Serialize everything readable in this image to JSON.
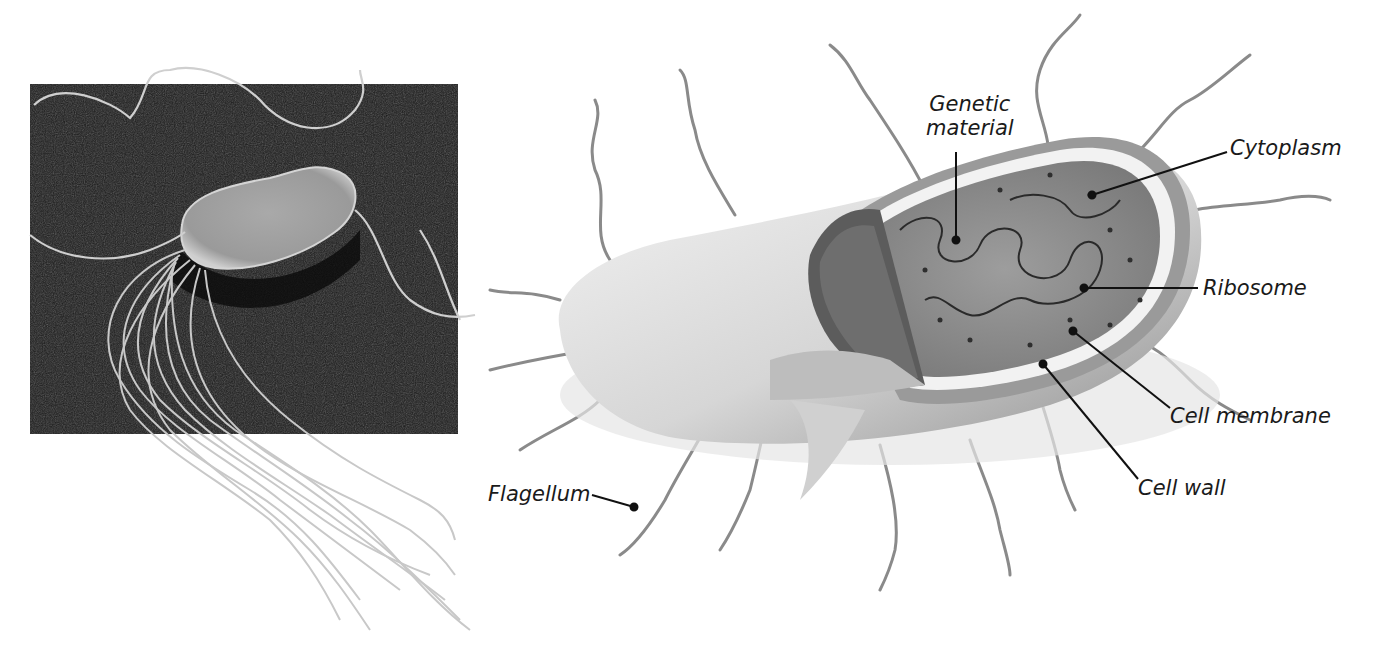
{
  "micrograph": {
    "subject": "bacterium-electron-micrograph",
    "background_color": "#1c1c1c"
  },
  "diagram": {
    "labels": {
      "genetic_material_line1": "Genetic",
      "genetic_material_line2": "material",
      "cytoplasm": "Cytoplasm",
      "ribosome": "Ribosome",
      "cell_membrane": "Cell membrane",
      "cell_wall": "Cell wall",
      "flagellum": "Flagellum"
    },
    "colors": {
      "flagella": "#8a8a8a",
      "cell_outer": "#d8d8d8",
      "cytoplasm": "#8c8c8c",
      "leader_line": "#111111"
    }
  }
}
